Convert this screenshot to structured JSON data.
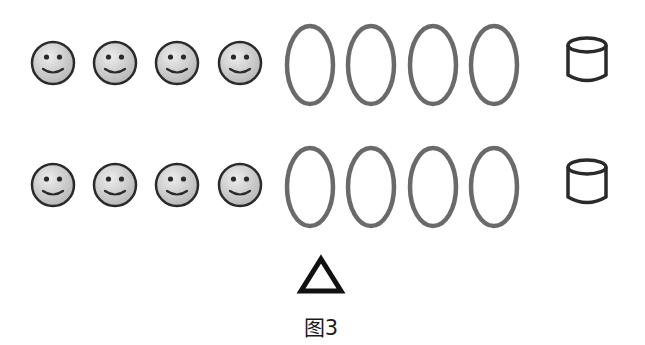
{
  "figure": {
    "caption": "图3",
    "colors": {
      "stroke_dark": "#2a2a2a",
      "oval_stroke": "#6a6a6a",
      "face_fill_light": "#e8e8e8",
      "face_fill_dark": "#b8b8b8"
    },
    "rows": [
      {
        "smileys": [
          {
            "icon": "smiley-face-icon",
            "cx": 53,
            "cy": 63
          },
          {
            "icon": "smiley-face-icon",
            "cx": 115,
            "cy": 63
          },
          {
            "icon": "smiley-face-icon",
            "cx": 177,
            "cy": 63
          },
          {
            "icon": "smiley-face-icon",
            "cx": 240,
            "cy": 63
          }
        ],
        "ovals": [
          {
            "icon": "oval-icon",
            "cx": 310,
            "cy": 65
          },
          {
            "icon": "oval-icon",
            "cx": 371,
            "cy": 65
          },
          {
            "icon": "oval-icon",
            "cx": 433,
            "cy": 65
          },
          {
            "icon": "oval-icon",
            "cx": 494,
            "cy": 65
          }
        ],
        "cylinder": {
          "icon": "cylinder-icon",
          "x": 566,
          "y": 36
        }
      },
      {
        "smileys": [
          {
            "icon": "smiley-face-icon",
            "cx": 53,
            "cy": 185
          },
          {
            "icon": "smiley-face-icon",
            "cx": 115,
            "cy": 185
          },
          {
            "icon": "smiley-face-icon",
            "cx": 177,
            "cy": 185
          },
          {
            "icon": "smiley-face-icon",
            "cx": 240,
            "cy": 185
          }
        ],
        "ovals": [
          {
            "icon": "oval-icon",
            "cx": 310,
            "cy": 187
          },
          {
            "icon": "oval-icon",
            "cx": 371,
            "cy": 187
          },
          {
            "icon": "oval-icon",
            "cx": 433,
            "cy": 187
          },
          {
            "icon": "oval-icon",
            "cx": 494,
            "cy": 187
          }
        ],
        "cylinder": {
          "icon": "cylinder-icon",
          "x": 566,
          "y": 158
        }
      }
    ],
    "pointer": {
      "icon": "triangle-icon"
    }
  }
}
